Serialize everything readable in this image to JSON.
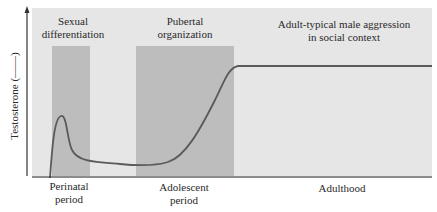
{
  "figure": {
    "y_axis_label": "Testosterone (——)",
    "phases_top": [
      {
        "id": "sexual-differentiation",
        "lines": [
          "Sexual",
          "differentiation"
        ]
      },
      {
        "id": "pubertal-organization",
        "lines": [
          "Pubertal",
          "organization"
        ]
      },
      {
        "id": "adult-aggression",
        "lines": [
          "Adult-typical male aggression",
          "in social context"
        ]
      }
    ],
    "periods_bottom": [
      {
        "id": "perinatal",
        "lines": [
          "Perinatal",
          "period"
        ]
      },
      {
        "id": "adolescent",
        "lines": [
          "Adolescent",
          "period"
        ]
      },
      {
        "id": "adulthood",
        "lines": [
          "Adulthood"
        ]
      }
    ],
    "colors": {
      "panel": "#e6e6e6",
      "band": "#bdbdbd",
      "curve": "#5a5a5a",
      "axis": "#333333",
      "text": "#2a2a2a"
    },
    "curve_description": "Testosterone rises sharply perinatally, drops to a low level through childhood, rises during adolescence, and plateaus in adulthood"
  }
}
